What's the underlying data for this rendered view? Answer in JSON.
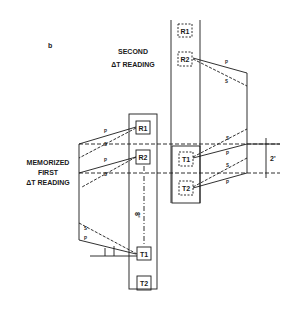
{
  "figure": {
    "panel_label": "b",
    "second_reading_label": [
      "SECOND",
      "ΔT READING"
    ],
    "first_reading_label": [
      "MEMORIZED",
      "FIRST",
      "ΔT READING"
    ],
    "upper_tool": {
      "receivers": [
        "R1",
        "R2"
      ],
      "transmitters": [
        "T1",
        "T2"
      ]
    },
    "lower_tool": {
      "receivers": [
        "R1",
        "R2"
      ],
      "transmitters": [
        "T1",
        "T2"
      ]
    },
    "spacing_vertical": "8'",
    "spacing_span": "2'",
    "ray_labels": {
      "p": "P",
      "s": "S"
    }
  }
}
